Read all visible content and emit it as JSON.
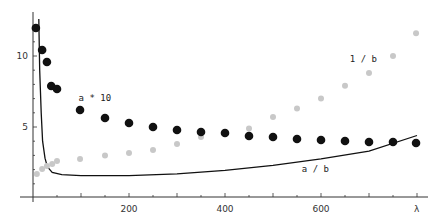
{
  "chart_data": {
    "type": "scatter",
    "title": "",
    "xlabel": "λ",
    "ylabel": "",
    "xlim": [
      0,
      800
    ],
    "ylim": [
      0,
      12.5
    ],
    "grid": false,
    "legend": "inline annotations",
    "x_ticks": [
      200,
      400,
      600
    ],
    "y_ticks": [
      5,
      10
    ],
    "annotations": [
      {
        "text": "a * 10",
        "x": 95,
        "y": 6.8
      },
      {
        "text": "1 / b",
        "x": 660,
        "y": 9.6
      },
      {
        "text": "a / b",
        "x": 560,
        "y": 1.8
      }
    ],
    "series": [
      {
        "name": "a * 10",
        "style": "black filled dots",
        "color": "#111111",
        "x": [
          6,
          19,
          29,
          38,
          50,
          98,
          150,
          200,
          250,
          300,
          350,
          400,
          450,
          500,
          550,
          600,
          650,
          700,
          750,
          798
        ],
        "y": [
          11.97,
          10.42,
          9.58,
          7.89,
          7.68,
          6.2,
          5.63,
          5.28,
          5.0,
          4.79,
          4.65,
          4.58,
          4.37,
          4.3,
          4.15,
          4.08,
          4.01,
          3.94,
          3.94,
          3.87
        ]
      },
      {
        "name": "1 / b",
        "style": "light gray dots",
        "color": "#c8c8c8",
        "x": [
          8,
          19,
          29,
          40,
          50,
          98,
          150,
          200,
          250,
          300,
          350,
          400,
          450,
          500,
          550,
          600,
          650,
          700,
          750,
          798
        ],
        "y": [
          1.69,
          2.04,
          2.25,
          2.39,
          2.6,
          2.75,
          3.0,
          3.17,
          3.38,
          3.8,
          4.3,
          4.5,
          4.9,
          5.7,
          6.3,
          7.0,
          7.9,
          8.8,
          10.0,
          11.6
        ]
      },
      {
        "name": "a / b",
        "style": "solid black line",
        "color": "#111111",
        "x": [
          12,
          14,
          17,
          20,
          25,
          30,
          40,
          60,
          100,
          200,
          300,
          400,
          500,
          600,
          700,
          800
        ],
        "y": [
          12.6,
          9.0,
          6.0,
          4.0,
          2.8,
          2.2,
          1.8,
          1.65,
          1.58,
          1.58,
          1.7,
          1.95,
          2.3,
          2.75,
          3.3,
          4.4
        ]
      }
    ]
  }
}
